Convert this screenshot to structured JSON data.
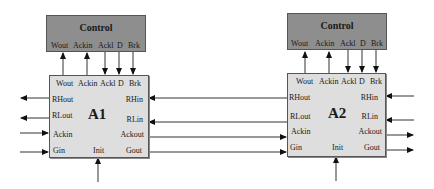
{
  "diagram": {
    "modules": [
      {
        "name": "A1",
        "control": {
          "title": "Control",
          "ports": [
            "Wout",
            "Ackin",
            "Ackl",
            "D",
            "Brk"
          ]
        },
        "unit": {
          "top_ports": [
            "Wout",
            "Ackin",
            "Ackl",
            "D",
            "Brk"
          ],
          "left_ports": [
            "RHout",
            "RLout",
            "Ackin",
            "Gin"
          ],
          "right_ports": [
            "RHin",
            "RLin",
            "Ackout",
            "Gout"
          ],
          "bottom_port": "Init"
        }
      },
      {
        "name": "A2",
        "control": {
          "title": "Control",
          "ports": [
            "Wout",
            "Ackin",
            "Ackl",
            "D",
            "Brk"
          ]
        },
        "unit": {
          "top_ports": [
            "Wout",
            "Ackin",
            "Ackl",
            "D",
            "Brk"
          ],
          "left_ports": [
            "RHout",
            "RLout",
            "Ackin",
            "Gin"
          ],
          "right_ports": [
            "RHin",
            "RLin",
            "Ackout",
            "Gout"
          ],
          "bottom_port": "Init"
        }
      }
    ],
    "connections": [
      {
        "from": "A1.Wout",
        "to": "Control1.Wout",
        "direction": "up"
      },
      {
        "from": "A1.Ackin",
        "to": "Control1.Ackin",
        "direction": "up"
      },
      {
        "from": "Control1.Ackl",
        "to": "A1.Ackl",
        "direction": "down"
      },
      {
        "from": "Control1.D",
        "to": "A1.D",
        "direction": "down"
      },
      {
        "from": "Control1.Brk",
        "to": "A1.Brk",
        "direction": "down"
      },
      {
        "from": "A2.RHout",
        "to": "A1.RHin"
      },
      {
        "from": "A2.RLout",
        "to": "A1.RLin"
      },
      {
        "from": "A1.Ackout",
        "to": "A2.Ackin"
      },
      {
        "from": "A1.Gout",
        "to": "A2.Gin"
      },
      {
        "from": "A1.RHout",
        "to": "external-left"
      },
      {
        "from": "A1.RLout",
        "to": "external-left"
      },
      {
        "from": "external-left",
        "to": "A1.Ackin"
      },
      {
        "from": "external-left",
        "to": "A1.Gin"
      },
      {
        "from": "external-bottom",
        "to": "A1.Init"
      },
      {
        "from": "external-right",
        "to": "A2.RHin"
      },
      {
        "from": "external-right",
        "to": "A2.RLin"
      },
      {
        "from": "A2.Ackout",
        "to": "external-right"
      },
      {
        "from": "A2.Gout",
        "to": "external-right"
      },
      {
        "from": "external-bottom",
        "to": "A2.Init"
      }
    ]
  }
}
